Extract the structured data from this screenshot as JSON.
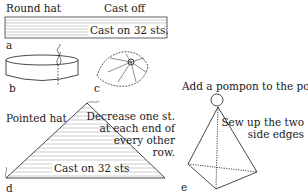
{
  "figure": {
    "round_hat": {
      "title": "Round hat",
      "cast_off_label": "Cast off",
      "strip_label": "Cast on 32 sts.",
      "panel_labels": {
        "a": "a",
        "b": "b",
        "c": "c"
      }
    },
    "pointed_hat": {
      "title": "Pointed hat",
      "strip_label": "Cast on 32 sts",
      "instruction_lines": [
        "Decrease one st.",
        "at each end of",
        "every other",
        "row."
      ],
      "panel_label_d": "d"
    },
    "pyramid": {
      "pompon_label": "Add a pompon to the point",
      "sew_lines": [
        "Sew up the two",
        "side edges"
      ],
      "panel_label_e": "e"
    }
  },
  "colors": {
    "ink": "#1a1a1a",
    "hatch": "#9a9a9a",
    "background": "#ffffff"
  }
}
